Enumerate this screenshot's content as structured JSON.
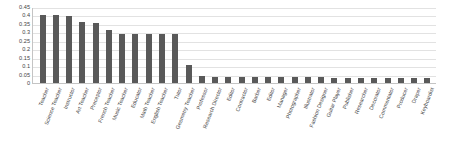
{
  "chart_data": {
    "type": "bar",
    "title": "",
    "subtitle": "",
    "xlabel": "",
    "ylabel": "",
    "ylim": [
      0,
      0.45
    ],
    "grid": true,
    "legend": null,
    "orientation": "vertical",
    "bar_color": "#595959",
    "gridline_color": "#e2e2e2",
    "axis_color": "#c4c4c4",
    "text_color": "#3f3f3f",
    "ytick_labels": [
      "0.45",
      "0.4",
      "0.35",
      "0.3",
      "0.25",
      "0.2",
      "0.15",
      "0.1",
      "0.05",
      "0"
    ],
    "ytick_values": [
      0.45,
      0.4,
      0.35,
      0.3,
      0.25,
      0.2,
      0.15,
      0.1,
      0.05,
      0
    ],
    "categories": [
      "Teacher",
      "Science Teacher",
      "Instructor",
      "Art Teacher",
      "Preceptor",
      "French Teacher",
      "Music Teacher",
      "Educator",
      "Math Teacher",
      "English Teacher",
      "Tutor",
      "Geometry Teacher",
      "Professor",
      "Research Director",
      "Editor",
      "Contractor",
      "Barber",
      "Editor",
      "Manager",
      "Photographer",
      "Illustrator",
      "Fashion Designer",
      "Guitar Player",
      "Publisher",
      "Researcher",
      "Decorator",
      "Commentator",
      "Producer",
      "Draper",
      "Keyboardist"
    ],
    "values": [
      0.405,
      0.4,
      0.395,
      0.36,
      0.355,
      0.315,
      0.29,
      0.29,
      0.29,
      0.29,
      0.29,
      0.105,
      0.04,
      0.035,
      0.035,
      0.035,
      0.035,
      0.035,
      0.035,
      0.035,
      0.035,
      0.035,
      0.03,
      0.03,
      0.03,
      0.03,
      0.03,
      0.03,
      0.028,
      0.028
    ]
  }
}
